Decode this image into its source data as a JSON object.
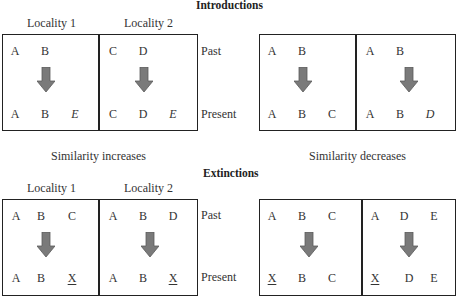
{
  "sections": [
    {
      "title": "Introductions",
      "locality_labels": [
        "Locality 1",
        "Locality 2"
      ],
      "row_labels": {
        "past": "Past",
        "present": "Present"
      },
      "panels": [
        {
          "caption": "Similarity increases",
          "localities": [
            {
              "past": [
                "A",
                "B",
                ""
              ],
              "present": [
                "A",
                "B",
                "E"
              ],
              "present_style": [
                "",
                "",
                "italic"
              ]
            },
            {
              "past": [
                "C",
                "D",
                ""
              ],
              "present": [
                "C",
                "D",
                "E"
              ],
              "present_style": [
                "",
                "",
                "italic"
              ]
            }
          ]
        },
        {
          "caption": "Similarity decreases",
          "localities": [
            {
              "past": [
                "A",
                "B",
                ""
              ],
              "present": [
                "A",
                "B",
                "C"
              ],
              "present_style": [
                "",
                "",
                ""
              ]
            },
            {
              "past": [
                "A",
                "B",
                ""
              ],
              "present": [
                "A",
                "B",
                "D"
              ],
              "present_style": [
                "",
                "",
                "italic"
              ]
            }
          ]
        }
      ]
    },
    {
      "title": "Extinctions",
      "locality_labels": [
        "Locality 1",
        "Locality 2"
      ],
      "row_labels": {
        "past": "Past",
        "present": "Present"
      },
      "panels": [
        {
          "localities": [
            {
              "past": [
                "A",
                "B",
                "C"
              ],
              "present": [
                "A",
                "B",
                "X"
              ],
              "present_style": [
                "",
                "",
                "underline"
              ]
            },
            {
              "past": [
                "A",
                "B",
                "D"
              ],
              "present": [
                "A",
                "B",
                "X"
              ],
              "present_style": [
                "",
                "",
                "underline"
              ]
            }
          ]
        },
        {
          "localities": [
            {
              "past": [
                "A",
                "B",
                "C"
              ],
              "present": [
                "X",
                "B",
                "C"
              ],
              "present_style": [
                "underline",
                "",
                ""
              ]
            },
            {
              "past": [
                "A",
                "D",
                "E"
              ],
              "present": [
                "X",
                "D",
                "E"
              ],
              "present_style": [
                "underline",
                "",
                ""
              ]
            }
          ]
        }
      ]
    }
  ],
  "colors": {
    "arrow": "#7a7a7a",
    "arrow_edge": "#5a5a5a",
    "border": "#222222"
  }
}
